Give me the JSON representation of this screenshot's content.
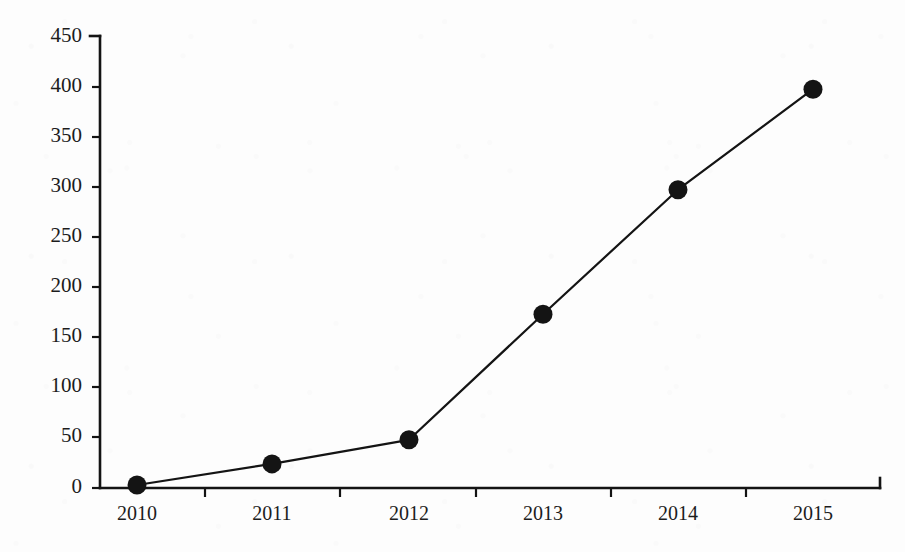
{
  "chart_data": {
    "type": "line",
    "title": "",
    "subtitle": "",
    "xlabel": "",
    "ylabel": "",
    "categories": [
      "2010",
      "2011",
      "2012",
      "2013",
      "2014",
      "2015"
    ],
    "x": [
      2010,
      2011,
      2012,
      2013,
      2014,
      2015
    ],
    "values": [
      3,
      24,
      48,
      173,
      297,
      397
    ],
    "series": [
      {
        "name": "",
        "values": [
          3,
          24,
          48,
          173,
          297,
          397
        ]
      }
    ],
    "ylim": [
      0,
      450
    ],
    "yticks": [
      0,
      50,
      100,
      150,
      200,
      250,
      300,
      350,
      400,
      450
    ],
    "ytick_labels": [
      "0",
      "50",
      "100",
      "150",
      "200",
      "250",
      "300",
      "350",
      "400",
      "450"
    ],
    "xtick_labels": [
      "2010",
      "2011",
      "2012",
      "2013",
      "2014",
      "2015"
    ],
    "grid": false,
    "legend": false,
    "legend_position": "none",
    "marker": "filled-circle",
    "line_color": "#141414",
    "marker_color": "#141414",
    "axis_color": "#141414",
    "background_color": "#fdfdfd",
    "annotations": []
  },
  "figure": {
    "axis_top_value": "450",
    "axis_bottom_value": "0"
  }
}
